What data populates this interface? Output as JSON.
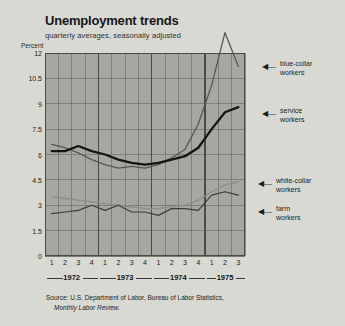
{
  "header": {
    "title": "Unemployment trends",
    "subtitle": "quarterly averages, seasonally adjusted",
    "y_axis_caption": "Percent"
  },
  "source": {
    "line1": "Source: U.S. Department of Labor, Bureau of Labor Statistics,",
    "line2": "Monthly Labor Review."
  },
  "callouts": {
    "blue_collar": "blue-collar\nworkers",
    "service": "service\nworkers",
    "white_collar": "white-collar\nworkers",
    "farm": "farm\nworkers",
    "arrow_glyph": "◀—"
  },
  "colors": {
    "page_background": "#d9d9d4",
    "plot_background": "#a6a6a2",
    "grid": "#6f6f6c",
    "service_line": "#141414",
    "blue_collar_line": "#565654",
    "white_collar_line": "#8c8c89",
    "farm_line": "#3d3d3b",
    "text": "#1b1b1b"
  },
  "chart_data": {
    "type": "line",
    "title": "Unemployment trends",
    "subtitle": "quarterly averages, seasonally adjusted",
    "xlabel": "",
    "ylabel": "Percent",
    "ylim": [
      0,
      12
    ],
    "yticks": [
      0,
      1.5,
      3,
      4.5,
      6,
      7.5,
      9,
      10.5,
      12
    ],
    "ytick_labels": [
      "0",
      "1.5",
      "3",
      "4.5",
      "6",
      "7.5",
      "9",
      "10.5",
      "12"
    ],
    "grid": true,
    "legend": "annotations-at-right",
    "x": [
      "1972 Q1",
      "1972 Q2",
      "1972 Q3",
      "1972 Q4",
      "1973 Q1",
      "1973 Q2",
      "1973 Q3",
      "1973 Q4",
      "1974 Q1",
      "1974 Q2",
      "1974 Q3",
      "1974 Q4",
      "1975 Q1",
      "1975 Q2",
      "1975 Q3"
    ],
    "quarter_labels": [
      "1",
      "2",
      "3",
      "4",
      "1",
      "2",
      "3",
      "4",
      "1",
      "2",
      "3",
      "4",
      "1",
      "2",
      "3"
    ],
    "years": [
      {
        "label": "1972",
        "quarters": 4
      },
      {
        "label": "1973",
        "quarters": 4
      },
      {
        "label": "1974",
        "quarters": 4
      },
      {
        "label": "1975",
        "quarters": 3
      }
    ],
    "series": [
      {
        "name": "blue-collar workers",
        "color": "#565654",
        "note": "peak rises above the 12 percent axis top in 1975 Q2",
        "values": [
          6.6,
          6.4,
          6.1,
          5.7,
          5.4,
          5.2,
          5.3,
          5.2,
          5.4,
          5.8,
          6.3,
          7.8,
          10.1,
          13.2,
          11.2
        ]
      },
      {
        "name": "service workers",
        "color": "#141414",
        "values": [
          6.2,
          6.2,
          6.5,
          6.2,
          6.0,
          5.7,
          5.5,
          5.4,
          5.5,
          5.7,
          5.9,
          6.4,
          7.5,
          8.5,
          8.8
        ]
      },
      {
        "name": "white-collar workers",
        "color": "#8c8c89",
        "values": [
          3.5,
          3.4,
          3.3,
          3.2,
          3.1,
          3.0,
          2.9,
          2.8,
          2.8,
          2.9,
          3.0,
          3.3,
          3.8,
          4.2,
          4.4
        ]
      },
      {
        "name": "farm workers",
        "color": "#3d3d3b",
        "values": [
          2.5,
          2.6,
          2.7,
          3.0,
          2.7,
          3.0,
          2.6,
          2.6,
          2.4,
          2.8,
          2.8,
          2.7,
          3.6,
          3.8,
          3.6
        ]
      }
    ]
  }
}
